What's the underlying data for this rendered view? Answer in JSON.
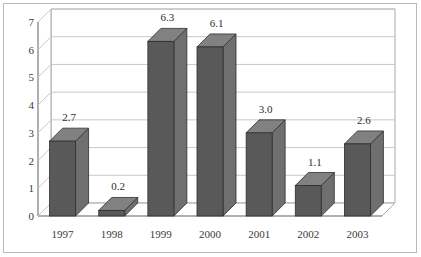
{
  "chart_data": {
    "type": "bar",
    "title": "",
    "subtitle": "",
    "xlabel": "",
    "ylabel": "",
    "categories": [
      "1997",
      "1998",
      "1999",
      "2000",
      "2001",
      "2002",
      "2003"
    ],
    "values": [
      2.7,
      0.2,
      6.3,
      6.1,
      3.0,
      1.1,
      2.6
    ],
    "value_labels": [
      "2.7",
      "0.2",
      "6.3",
      "6.1",
      "3.0",
      "1.1",
      "2.6"
    ],
    "ylim": [
      0,
      7
    ],
    "yticks": [
      0,
      1,
      2,
      3,
      4,
      5,
      6,
      7
    ],
    "ytick_labels": [
      "0",
      "1",
      "2",
      "3",
      "4",
      "5",
      "6",
      "7"
    ],
    "grid": true,
    "grid_axis": "y",
    "legend": false,
    "legend_position": "none",
    "three_d": true,
    "series": [
      {
        "name": "",
        "values": [
          2.7,
          0.2,
          6.3,
          6.1,
          3.0,
          1.1,
          2.6
        ]
      }
    ]
  },
  "style": {
    "background": "#ffffff",
    "border_color": "#b9b9b9",
    "bar_front": "#595959",
    "bar_side": "#6f6f6f",
    "bar_top": "#818181",
    "bar_edge": "#2f2f2f",
    "grid_color": "#c8c8c8",
    "axis_color": "#8a8a8a",
    "wall_color": "#a9a9a9",
    "text_color": "#3a3a3a"
  }
}
